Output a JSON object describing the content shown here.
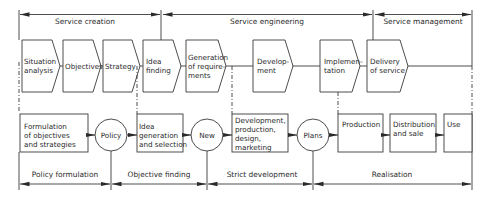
{
  "diagram": {
    "top_phases": [
      {
        "label": "Service creation",
        "x": 85
      },
      {
        "label": "Service engineering",
        "x": 267
      },
      {
        "label": "Service management",
        "x": 423
      }
    ],
    "top_steps": [
      {
        "label": "Situation\nanalysis"
      },
      {
        "label": "Objectives"
      },
      {
        "label": "Strategy"
      },
      {
        "label": "Idea\nfinding"
      },
      {
        "label": "Generation\nof require-\nments"
      },
      {
        "label": "Develop-\nment"
      },
      {
        "label": "Implemen-\ntation"
      },
      {
        "label": "Delivery\nof service"
      }
    ],
    "bottom_steps": [
      {
        "label": "Formulation\nof objectives\nand strategies",
        "kind": "box"
      },
      {
        "label": "Policy",
        "kind": "circle"
      },
      {
        "label": "Idea\ngeneration\nand selection",
        "kind": "box"
      },
      {
        "label": "New",
        "kind": "circle"
      },
      {
        "label": "Development,\nproduction,\ndesign,\nmarketing",
        "kind": "box"
      },
      {
        "label": "Plans",
        "kind": "circle"
      },
      {
        "label": "Production",
        "kind": "box"
      },
      {
        "label": "Distribution\nand sale",
        "kind": "box"
      },
      {
        "label": "Use",
        "kind": "box"
      }
    ],
    "bottom_phases": [
      {
        "label": "Policy formulation"
      },
      {
        "label": "Objective finding"
      },
      {
        "label": "Strict development"
      },
      {
        "label": "Realisation"
      }
    ],
    "colors": {
      "stroke": "#3a3a3a",
      "text": "#2a2a2a",
      "background": "#ffffff"
    }
  }
}
